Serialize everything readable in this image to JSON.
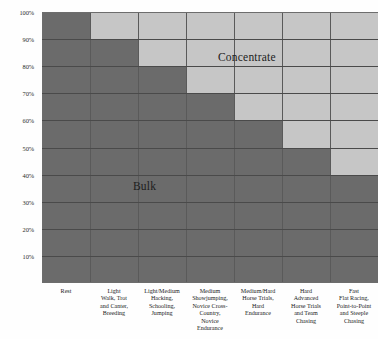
{
  "chart_data": {
    "type": "bar",
    "stacked": true,
    "title": "",
    "xlabel": "",
    "ylabel": "",
    "ylim": [
      0,
      100
    ],
    "grid": true,
    "legend_position": "in-plot",
    "y_ticks": [
      "10%",
      "20%",
      "30%",
      "40%",
      "50%",
      "60%",
      "70%",
      "80%",
      "90%",
      "100%"
    ],
    "y_tick_values": [
      10,
      20,
      30,
      40,
      50,
      60,
      70,
      80,
      90,
      100
    ],
    "categories": [
      "Rest",
      "Light Walk, Trot and Canter, Breeding",
      "Light/Medium Hacking, Schooling, Jumping",
      "Medium Showjumping, Novice Cross-Country, Novice Endurance",
      "Medium/Hard Horse Trials, Hard Endurance",
      "Hard Advanced Horse Trials and Team Chasing",
      "Fast Flat Racing, Point-to-Point and Steeple Chasing"
    ],
    "category_lines": [
      [
        "Rest"
      ],
      [
        "Light",
        "Walk, Trot",
        "and Canter,",
        "Breeding"
      ],
      [
        "Light/Medium",
        "Hacking,",
        "Schooling,",
        "Jumping"
      ],
      [
        "Medium",
        "Showjumping,",
        "Novice Cross-",
        "Country,",
        "Novice",
        "Endurance"
      ],
      [
        "Medium/Hard",
        "Horse Trials,",
        "Hard",
        "Endurance"
      ],
      [
        "Hard",
        "Advanced",
        "Horse Trials",
        "and Team",
        "Chasing"
      ],
      [
        "Fast",
        "Flat Racing,",
        "Point-to-Point",
        "and Steeple",
        "Chasing"
      ]
    ],
    "series": [
      {
        "name": "Bulk",
        "color": "#6b6b6b",
        "values": [
          100,
          90,
          80,
          70,
          60,
          50,
          40
        ]
      },
      {
        "name": "Concentrate",
        "color": "#c6c6c6",
        "values": [
          0,
          10,
          20,
          30,
          40,
          50,
          60
        ]
      }
    ],
    "annotations": [
      {
        "text": "Concentrate",
        "name": "concentrate-series-label"
      },
      {
        "text": "Bulk",
        "name": "bulk-series-label"
      }
    ]
  }
}
